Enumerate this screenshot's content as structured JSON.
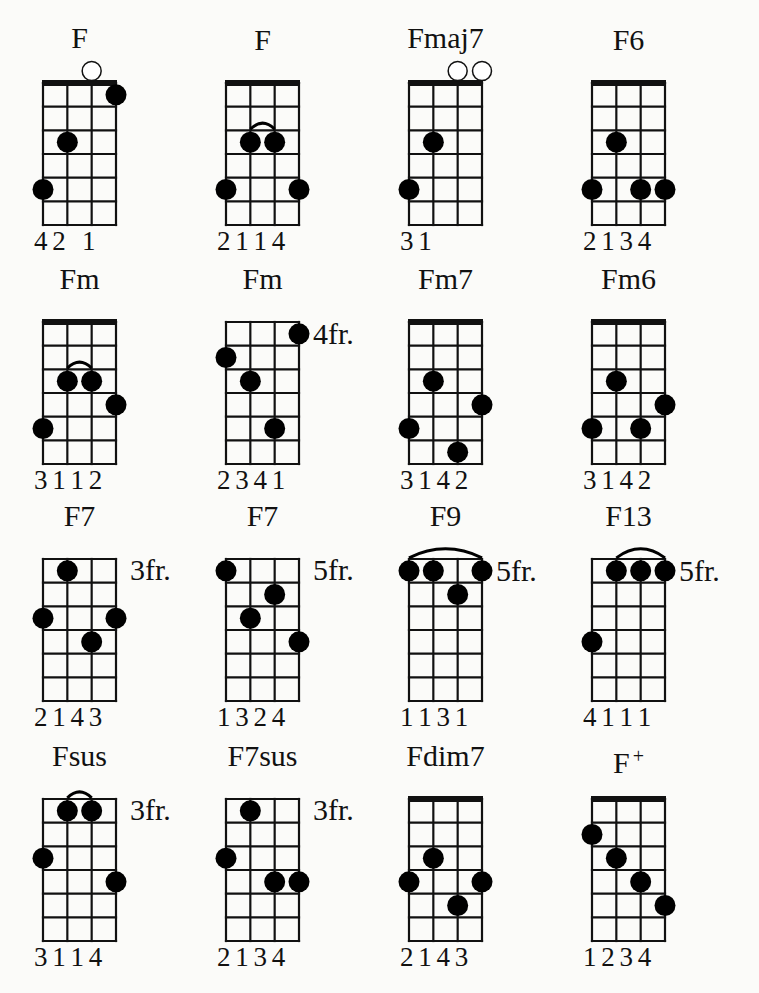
{
  "chart_title": "F chords (ukulele chord diagrams)",
  "diagram_settings": {
    "strings": 4,
    "frets_shown": 6,
    "dot_color": "#000000",
    "line_color": "#111111",
    "background": "#fbfbf9"
  },
  "chords": [
    {
      "name": "F",
      "sup": "",
      "nut": true,
      "fret_label": "",
      "open": [
        3
      ],
      "dots": [
        [
          1,
          5
        ],
        [
          2,
          3
        ],
        [
          4,
          1
        ]
      ],
      "barre": null,
      "fingering": "4 2   1"
    },
    {
      "name": "F",
      "sup": "",
      "nut": true,
      "fret_label": "",
      "open": [],
      "dots": [
        [
          1,
          5
        ],
        [
          2,
          3
        ],
        [
          3,
          3
        ],
        [
          4,
          5
        ]
      ],
      "barre": [
        2,
        3,
        3
      ],
      "fingering": "2 1 1 4"
    },
    {
      "name": "Fmaj7",
      "sup": "",
      "nut": true,
      "fret_label": "",
      "open": [
        3,
        4
      ],
      "dots": [
        [
          1,
          5
        ],
        [
          2,
          3
        ]
      ],
      "barre": null,
      "fingering": "3 1"
    },
    {
      "name": "F6",
      "sup": "",
      "nut": true,
      "fret_label": "",
      "open": [],
      "dots": [
        [
          1,
          5
        ],
        [
          2,
          3
        ],
        [
          3,
          5
        ],
        [
          4,
          5
        ]
      ],
      "barre": null,
      "fingering": "2 1 3 4"
    },
    {
      "name": "Fm",
      "sup": "",
      "nut": true,
      "fret_label": "",
      "open": [],
      "dots": [
        [
          1,
          5
        ],
        [
          2,
          3
        ],
        [
          3,
          3
        ],
        [
          4,
          4
        ]
      ],
      "barre": [
        2,
        3,
        3
      ],
      "fingering": "3 1 1 2"
    },
    {
      "name": "Fm",
      "sup": "",
      "nut": false,
      "fret_label": "4fr.",
      "open": [],
      "dots": [
        [
          1,
          2
        ],
        [
          2,
          3
        ],
        [
          3,
          5
        ],
        [
          4,
          1
        ]
      ],
      "barre": null,
      "fingering": "2 3 4 1"
    },
    {
      "name": "Fm7",
      "sup": "",
      "nut": true,
      "fret_label": "",
      "open": [],
      "dots": [
        [
          1,
          5
        ],
        [
          2,
          3
        ],
        [
          3,
          6
        ],
        [
          4,
          4
        ]
      ],
      "barre": null,
      "fingering": "3 1 4 2"
    },
    {
      "name": "Fm6",
      "sup": "",
      "nut": true,
      "fret_label": "",
      "open": [],
      "dots": [
        [
          1,
          5
        ],
        [
          2,
          3
        ],
        [
          3,
          5
        ],
        [
          4,
          4
        ]
      ],
      "barre": null,
      "fingering": "3 1 4 2"
    },
    {
      "name": "F7",
      "sup": "",
      "nut": false,
      "fret_label": "3fr.",
      "open": [],
      "dots": [
        [
          1,
          3
        ],
        [
          2,
          1
        ],
        [
          3,
          4
        ],
        [
          4,
          3
        ]
      ],
      "barre": null,
      "fingering": "2 1 4 3"
    },
    {
      "name": "F7",
      "sup": "",
      "nut": false,
      "fret_label": "5fr.",
      "open": [],
      "dots": [
        [
          1,
          1
        ],
        [
          2,
          3
        ],
        [
          3,
          2
        ],
        [
          4,
          4
        ]
      ],
      "barre": null,
      "fingering": "1 3 2 4"
    },
    {
      "name": "F9",
      "sup": "",
      "nut": false,
      "fret_label": "5fr.",
      "open": [],
      "dots": [
        [
          1,
          1
        ],
        [
          2,
          1
        ],
        [
          3,
          2
        ],
        [
          4,
          1
        ]
      ],
      "barre": [
        1,
        4,
        1
      ],
      "fingering": "1 1 3 1"
    },
    {
      "name": "F13",
      "sup": "",
      "nut": false,
      "fret_label": "5fr.",
      "open": [],
      "dots": [
        [
          1,
          4
        ],
        [
          2,
          1
        ],
        [
          3,
          1
        ],
        [
          4,
          1
        ]
      ],
      "barre": [
        2,
        4,
        1
      ],
      "fingering": "4 1 1 1"
    },
    {
      "name": "Fsus",
      "sup": "",
      "nut": false,
      "fret_label": "3fr.",
      "open": [],
      "dots": [
        [
          1,
          3
        ],
        [
          2,
          1
        ],
        [
          3,
          1
        ],
        [
          4,
          4
        ]
      ],
      "barre": [
        2,
        3,
        1
      ],
      "fingering": "3 1 1 4"
    },
    {
      "name": "F7sus",
      "sup": "",
      "nut": false,
      "fret_label": "3fr.",
      "open": [],
      "dots": [
        [
          1,
          3
        ],
        [
          2,
          1
        ],
        [
          3,
          4
        ],
        [
          4,
          4
        ]
      ],
      "barre": null,
      "fingering": "2 1 3 4"
    },
    {
      "name": "Fdim7",
      "sup": "",
      "nut": true,
      "fret_label": "",
      "open": [],
      "dots": [
        [
          1,
          4
        ],
        [
          2,
          3
        ],
        [
          3,
          5
        ],
        [
          4,
          4
        ]
      ],
      "barre": null,
      "fingering": "2 1 4 3"
    },
    {
      "name": "F",
      "sup": "+",
      "nut": true,
      "fret_label": "",
      "open": [],
      "dots": [
        [
          1,
          2
        ],
        [
          2,
          3
        ],
        [
          3,
          4
        ],
        [
          4,
          5
        ]
      ],
      "barre": null,
      "fingering": "1 2 3 4"
    }
  ],
  "layout": {
    "column_left": [
      43,
      226,
      409,
      592
    ],
    "row_grid_top": [
      83,
      322,
      559,
      799
    ],
    "grid_width": 73,
    "grid_height": 142
  }
}
